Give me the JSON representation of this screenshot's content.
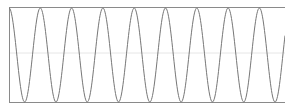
{
  "chart_data": {
    "type": "line",
    "title": "",
    "xlabel": "",
    "ylabel": "",
    "grid": "horizontal midline only",
    "legend": null,
    "ylim": [
      -1,
      1
    ],
    "xlim": [
      0,
      9
    ],
    "series": [
      {
        "name": "sine wave",
        "function": "y = sin(2*pi*x - pi/2) approx (starts at min, ~9 periods)",
        "cycles": 9,
        "peaks_x": [
          0.5,
          1.5,
          2.5,
          3.5,
          4.5,
          5.5,
          6.5,
          7.5,
          8.5
        ],
        "troughs_x": [
          0,
          1,
          2,
          3,
          4,
          5,
          6,
          7,
          8
        ],
        "color": "#777777"
      }
    ]
  },
  "colors": {
    "line": "#777777",
    "frame": "#888888",
    "midline": "#e4e4e4",
    "background": "#ffffff"
  }
}
